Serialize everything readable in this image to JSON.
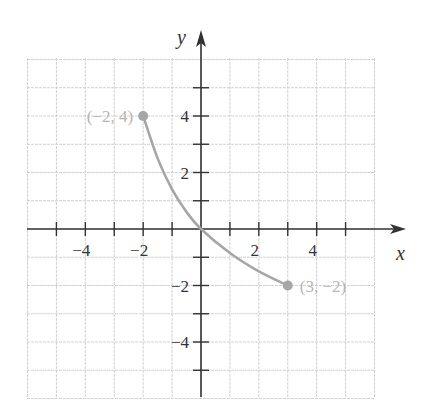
{
  "chart_data": {
    "type": "line",
    "title": "",
    "xlabel": "x",
    "ylabel": "y",
    "xlim": [
      -6,
      6
    ],
    "ylim": [
      -6,
      6
    ],
    "grid": true,
    "x_ticks": [
      -5,
      -4,
      -3,
      -2,
      -1,
      1,
      2,
      3,
      4,
      5
    ],
    "y_ticks": [
      -5,
      -4,
      -3,
      -2,
      -1,
      1,
      2,
      3,
      4,
      5
    ],
    "x_tick_labels": [
      {
        "value": -4,
        "label": "−4"
      },
      {
        "value": -2,
        "label": "−2"
      },
      {
        "value": 2,
        "label": "2"
      },
      {
        "value": 4,
        "label": "4"
      }
    ],
    "y_tick_labels": [
      {
        "value": 4,
        "label": "4"
      },
      {
        "value": 2,
        "label": "2"
      },
      {
        "value": -2,
        "label": "−2"
      },
      {
        "value": -4,
        "label": "−4"
      }
    ],
    "series": [
      {
        "name": "curve",
        "color": "#a6a6a6",
        "points": [
          [
            -2,
            4
          ],
          [
            -1.5,
            2.5
          ],
          [
            -1,
            1.4
          ],
          [
            -0.5,
            0.6
          ],
          [
            0,
            0
          ],
          [
            1,
            -0.85
          ],
          [
            2,
            -1.5
          ],
          [
            3,
            -2
          ]
        ]
      }
    ],
    "annotations": [
      {
        "x": -2,
        "y": 4,
        "label": "(−2, 4)",
        "position": "left"
      },
      {
        "x": 3,
        "y": -2,
        "label": "(3, −2)",
        "position": "right"
      }
    ]
  },
  "colors": {
    "axis": "#333333",
    "grid": "#d0d0d0",
    "curve": "#a6a6a6",
    "point": "#a6a6a6",
    "annotation_text": "#b5b5b5"
  }
}
